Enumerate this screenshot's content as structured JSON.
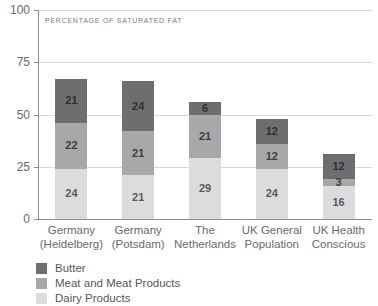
{
  "chart_data": {
    "type": "bar",
    "stacked": true,
    "title": "",
    "subtitle": "PERCENTAGE OF SATURATED FAT",
    "xlabel": "",
    "ylabel": "",
    "ylim": [
      0,
      100
    ],
    "yticks": [
      0,
      25,
      50,
      75,
      100
    ],
    "grid": true,
    "legend_position": "bottom-left",
    "categories": [
      "Germany\n(Heidelberg)",
      "Germany\n(Potsdam)",
      "The\nNetherlands",
      "UK General\nPopulation",
      "UK Health\nConscious"
    ],
    "category_lines": [
      [
        "Germany",
        "(Heidelberg)"
      ],
      [
        "Germany",
        "(Potsdam)"
      ],
      [
        "The",
        "Netherlands"
      ],
      [
        "UK General",
        "Population"
      ],
      [
        "UK Health",
        "Conscious"
      ]
    ],
    "series": [
      {
        "name": "Dairy Products",
        "color": "#dcdcde",
        "values": [
          24,
          21,
          29,
          24,
          16
        ]
      },
      {
        "name": "Meat and Meat Products",
        "color": "#a8a8aa",
        "values": [
          22,
          21,
          21,
          12,
          3
        ]
      },
      {
        "name": "Butter",
        "color": "#6e6e70",
        "values": [
          21,
          24,
          6,
          12,
          12
        ]
      }
    ],
    "totals": [
      67,
      66,
      56,
      48,
      31
    ],
    "ytick_labels": [
      "0",
      "25",
      "50",
      "75",
      "100"
    ]
  },
  "legend": {
    "items": [
      {
        "label": "Butter"
      },
      {
        "label": "Meat and Meat Products"
      },
      {
        "label": "Dairy Products"
      }
    ]
  }
}
